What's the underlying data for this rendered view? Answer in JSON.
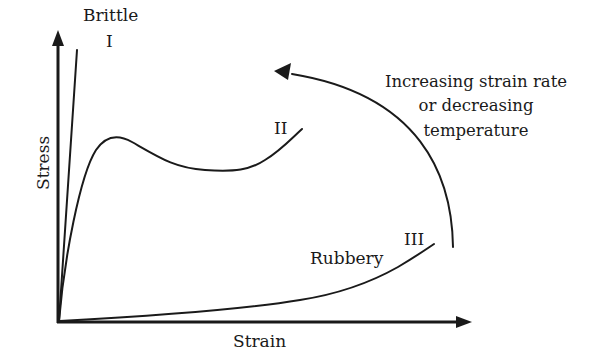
{
  "diagram": {
    "axes": {
      "x_label": "Strain",
      "y_label": "Stress"
    },
    "curves": [
      {
        "id": "I",
        "roman": "I",
        "name": "Brittle"
      },
      {
        "id": "II",
        "roman": "II",
        "name": ""
      },
      {
        "id": "III",
        "roman": "III",
        "name": "Rubbery"
      }
    ],
    "annotation": {
      "lines": [
        "Increasing strain rate",
        "or decreasing",
        "temperature"
      ],
      "arrow_direction": "from curve III toward curve I"
    },
    "colors": {
      "ink": "#1a1a1a",
      "background": "#ffffff"
    }
  }
}
